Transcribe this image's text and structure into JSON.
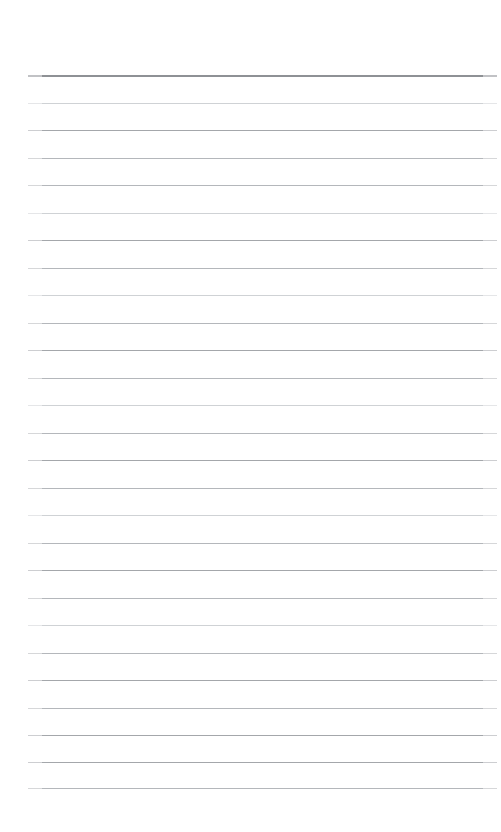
{
  "document": {
    "kind": "ruled-paper-page",
    "title": "",
    "body_text": "",
    "background_color": "#ffffff",
    "width_px": 501,
    "height_px": 832
  },
  "ruling": {
    "line_count": 27,
    "first_line_y": 75,
    "line_spacing_px": 27.4,
    "line_left_x": 28,
    "line_right_x": 497,
    "line_length_px": 469,
    "default_thickness_px": 1,
    "header_rule": {
      "index": 0,
      "y": 75,
      "thickness_px": 2,
      "color": "#8e9195",
      "note": "top rule is darker and thicker than the rest"
    },
    "colors": {
      "header": "#8e9195",
      "strong": "#a4a7ab",
      "medium": "#b4b7bb",
      "faint": "#cfd2d5"
    },
    "lines": [
      {
        "index": 0,
        "y": 75,
        "weight": "header",
        "thickness": 2
      },
      {
        "index": 1,
        "y": 103,
        "weight": "faint",
        "thickness": 1
      },
      {
        "index": 2,
        "y": 130,
        "weight": "strong",
        "thickness": 1
      },
      {
        "index": 3,
        "y": 158,
        "weight": "medium",
        "thickness": 1
      },
      {
        "index": 4,
        "y": 185,
        "weight": "medium",
        "thickness": 1
      },
      {
        "index": 5,
        "y": 213,
        "weight": "faint",
        "thickness": 1
      },
      {
        "index": 6,
        "y": 240,
        "weight": "strong",
        "thickness": 1
      },
      {
        "index": 7,
        "y": 268,
        "weight": "medium",
        "thickness": 1
      },
      {
        "index": 8,
        "y": 295,
        "weight": "faint",
        "thickness": 1
      },
      {
        "index": 9,
        "y": 323,
        "weight": "medium",
        "thickness": 1
      },
      {
        "index": 10,
        "y": 350,
        "weight": "strong",
        "thickness": 1
      },
      {
        "index": 11,
        "y": 378,
        "weight": "medium",
        "thickness": 1
      },
      {
        "index": 12,
        "y": 405,
        "weight": "faint",
        "thickness": 1
      },
      {
        "index": 13,
        "y": 433,
        "weight": "medium",
        "thickness": 1
      },
      {
        "index": 14,
        "y": 460,
        "weight": "strong",
        "thickness": 1
      },
      {
        "index": 15,
        "y": 488,
        "weight": "medium",
        "thickness": 1
      },
      {
        "index": 16,
        "y": 515,
        "weight": "faint",
        "thickness": 1
      },
      {
        "index": 17,
        "y": 543,
        "weight": "medium",
        "thickness": 1
      },
      {
        "index": 18,
        "y": 570,
        "weight": "strong",
        "thickness": 1
      },
      {
        "index": 19,
        "y": 598,
        "weight": "medium",
        "thickness": 1
      },
      {
        "index": 20,
        "y": 625,
        "weight": "faint",
        "thickness": 1
      },
      {
        "index": 21,
        "y": 653,
        "weight": "medium",
        "thickness": 1
      },
      {
        "index": 22,
        "y": 680,
        "weight": "strong",
        "thickness": 1
      },
      {
        "index": 23,
        "y": 708,
        "weight": "medium",
        "thickness": 1
      },
      {
        "index": 24,
        "y": 735,
        "weight": "strong",
        "thickness": 1
      },
      {
        "index": 25,
        "y": 762,
        "weight": "strong",
        "thickness": 1
      },
      {
        "index": 26,
        "y": 788,
        "weight": "medium",
        "thickness": 1
      }
    ]
  },
  "margins": {
    "top_px": 74,
    "left_px": 28,
    "right_px": 4,
    "bottom_px": 42
  }
}
